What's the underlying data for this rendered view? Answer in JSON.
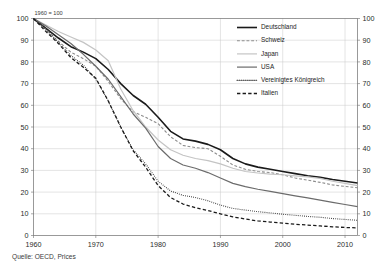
{
  "figure": {
    "annotation": "1960 = 100",
    "source": "Quelle: OECD, Prices"
  },
  "chart_data": {
    "type": "line",
    "title": "",
    "subtitle": "",
    "annotation": "1960 = 100",
    "source": "Quelle: OECD, Prices",
    "xlabel": "",
    "ylabel": "",
    "xlim": [
      1960,
      2012
    ],
    "ylim": [
      0,
      100
    ],
    "xticks": [
      1960,
      1970,
      1980,
      1990,
      2000,
      2010
    ],
    "yticks": [
      0,
      10,
      20,
      30,
      40,
      50,
      60,
      70,
      80,
      90,
      100
    ],
    "grid": true,
    "dual_y_axis": true,
    "legend_position": "upper right inside",
    "x": [
      1960,
      1962,
      1964,
      1966,
      1968,
      1970,
      1972,
      1974,
      1976,
      1978,
      1980,
      1982,
      1984,
      1986,
      1988,
      1990,
      1992,
      1994,
      1996,
      1998,
      2000,
      2002,
      2004,
      2006,
      2008,
      2010,
      2012
    ],
    "series": [
      {
        "name": "Deutschland",
        "color": "#1a1a1a",
        "style": "solid",
        "width": 1.6,
        "values": [
          100,
          95.5,
          91.0,
          87.0,
          84.5,
          81.5,
          76.5,
          70.0,
          64.5,
          60.5,
          54.5,
          48.0,
          44.5,
          43.5,
          42.0,
          39.5,
          35.5,
          33.0,
          31.5,
          30.5,
          29.5,
          28.5,
          27.5,
          26.8,
          25.8,
          25.0,
          24.2
        ]
      },
      {
        "name": "Schweiz",
        "color": "#8c8c8c",
        "style": "dashed",
        "width": 1.1,
        "values": [
          100,
          95.0,
          89.5,
          84.5,
          81.5,
          78.0,
          71.0,
          63.0,
          57.0,
          54.5,
          51.5,
          45.5,
          41.5,
          40.5,
          40.0,
          36.5,
          32.5,
          30.5,
          29.5,
          29.0,
          28.0,
          26.5,
          25.5,
          24.5,
          23.3,
          22.6,
          22.0
        ]
      },
      {
        "name": "Japan",
        "color": "#c4c4c4",
        "style": "solid",
        "width": 1.2,
        "values": [
          100,
          97.0,
          94.0,
          91.5,
          89.0,
          85.5,
          80.5,
          67.5,
          57.5,
          50.0,
          44.0,
          39.5,
          37.0,
          35.5,
          34.5,
          33.0,
          31.0,
          29.5,
          28.8,
          28.3,
          28.0,
          27.5,
          27.0,
          26.3,
          25.0,
          24.0,
          23.0
        ]
      },
      {
        "name": "USA",
        "color": "#6b6b6b",
        "style": "solid",
        "width": 1.2,
        "values": [
          100,
          96.5,
          92.5,
          88.5,
          83.5,
          78.0,
          72.0,
          64.0,
          56.0,
          49.5,
          41.0,
          35.5,
          32.5,
          31.0,
          29.0,
          26.5,
          24.0,
          22.5,
          21.3,
          20.3,
          19.3,
          18.3,
          17.3,
          16.3,
          15.3,
          14.3,
          13.3
        ]
      },
      {
        "name": "Vereinigtes Königreich",
        "color": "#2e2e2e",
        "style": "dotted",
        "width": 1.1,
        "values": [
          100,
          95.0,
          89.0,
          83.0,
          78.5,
          72.0,
          62.0,
          50.0,
          39.5,
          33.0,
          25.0,
          20.5,
          18.5,
          17.5,
          16.0,
          14.0,
          12.5,
          11.7,
          11.0,
          10.4,
          9.8,
          9.3,
          8.8,
          8.4,
          7.8,
          7.4,
          7.0
        ]
      },
      {
        "name": "Italien",
        "color": "#1a1a1a",
        "style": "dashed",
        "width": 1.3,
        "values": [
          100,
          94.0,
          88.5,
          82.0,
          77.5,
          72.5,
          62.0,
          50.0,
          39.0,
          31.5,
          23.0,
          17.5,
          14.5,
          12.8,
          11.5,
          10.0,
          8.6,
          7.6,
          6.7,
          6.2,
          5.7,
          5.2,
          4.8,
          4.4,
          4.0,
          3.7,
          3.5
        ]
      }
    ]
  },
  "legend": {
    "items": [
      {
        "label": "Deutschland"
      },
      {
        "label": "Schweiz"
      },
      {
        "label": "Japan"
      },
      {
        "label": "USA"
      },
      {
        "label": "Vereinigtes Königreich"
      },
      {
        "label": "Italien"
      }
    ]
  }
}
